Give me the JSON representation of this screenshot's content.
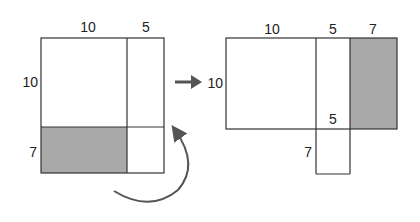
{
  "colors": {
    "stroke": "#333333",
    "shade": "#a9a9a9",
    "arrow": "#555555"
  },
  "left_figure": {
    "labels": {
      "top_left": "10",
      "top_right": "5",
      "side_top": "10",
      "side_bottom": "7"
    }
  },
  "right_figure": {
    "labels": {
      "top_left": "10",
      "top_middle": "5",
      "top_right": "7",
      "side": "10",
      "inner_bottom": "5",
      "bottom_side": "7"
    }
  }
}
